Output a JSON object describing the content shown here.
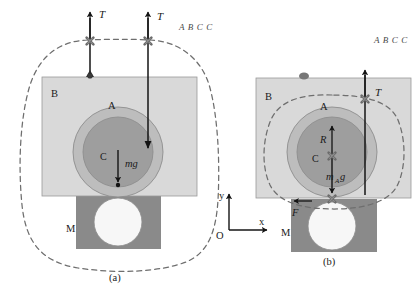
{
  "figure": {
    "background_color": "#ffffff",
    "panels": [
      {
        "id": "a",
        "caption": "(a)",
        "annotation": "A B C C",
        "boundary_style": "dashed-system-boundary",
        "labels": {
          "block_b": "B",
          "sphere_a": "A",
          "center": "C",
          "weight": "mg",
          "block_m": "M",
          "tension_left": "T",
          "tension_right": "T"
        }
      },
      {
        "id": "b",
        "caption": "(b)",
        "annotation": "A B C C",
        "boundary_style": "dashed-system-boundary",
        "labels": {
          "block_b": "B",
          "sphere_a": "A",
          "center": "C",
          "radius": "R",
          "weight": "m",
          "weight_sub": "A",
          "weight_tail": "g",
          "block_m": "M",
          "tension_right": "T",
          "friction": "F"
        }
      }
    ],
    "axes": {
      "origin_label": "O",
      "x_label": "x",
      "y_label": "y"
    },
    "colors": {
      "block_b_fill": "#d9d9d9",
      "block_m_fill": "#8a8a8a",
      "ring_fill": "#bdbdbd",
      "core_fill": "#9e9e9e",
      "white_circle": "#f7f7f7",
      "outline": "#7a7a7a",
      "arrow": "#141414",
      "dashed": "#6e6e6e",
      "marker": "#6b6b6b"
    }
  }
}
